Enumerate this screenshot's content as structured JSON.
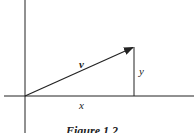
{
  "figure": {
    "caption": "Figure 1.2",
    "labels": {
      "vector": "v",
      "x_component": "x",
      "y_component": "y"
    },
    "geometry": {
      "origin": [
        25,
        96
      ],
      "vector_tip": [
        134,
        47
      ],
      "line_color": "#222222"
    }
  }
}
